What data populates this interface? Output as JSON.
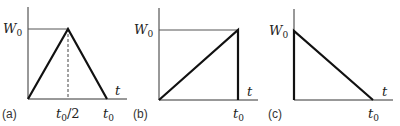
{
  "figure": {
    "panels": [
      {
        "id": "a",
        "label": "(a)",
        "shape": "triangle",
        "y_label": "W",
        "y_label_sub": "0",
        "x_label": "t",
        "ticks": [
          {
            "main": "t",
            "sub": "0",
            "suffix": "/2"
          },
          {
            "main": "t",
            "sub": "0",
            "suffix": ""
          }
        ]
      },
      {
        "id": "b",
        "label": "(b)",
        "shape": "ramp-up",
        "y_label": "W",
        "y_label_sub": "0",
        "x_label": "t",
        "ticks": [
          {
            "main": "t",
            "sub": "0",
            "suffix": ""
          }
        ]
      },
      {
        "id": "c",
        "label": "(c)",
        "shape": "ramp-down",
        "y_label": "W",
        "y_label_sub": "0",
        "x_label": "t",
        "ticks": [
          {
            "main": "t",
            "sub": "0",
            "suffix": ""
          }
        ]
      }
    ],
    "colors": {
      "axis": "#333333",
      "curve": "#111111",
      "guide": "#444444"
    }
  }
}
